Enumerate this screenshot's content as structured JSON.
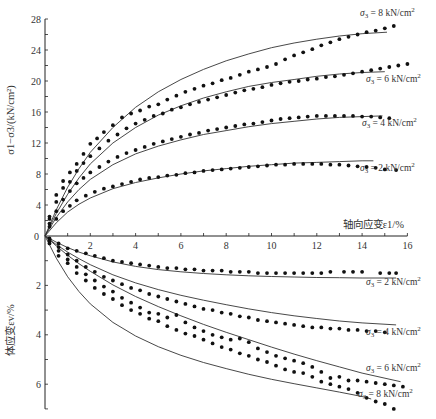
{
  "chart_data": [
    {
      "type": "scatter",
      "panel": "upper",
      "title": "",
      "xlabel": "轴向应变ε1/%",
      "ylabel": "σ1−σ3/(kN/cm²)",
      "xlim": [
        0,
        16
      ],
      "ylim": [
        0,
        28
      ],
      "xticks": [
        "2",
        "4",
        "6",
        "8",
        "10",
        "12",
        "14",
        "16"
      ],
      "xtick_values": [
        2,
        4,
        6,
        8,
        10,
        12,
        14,
        16
      ],
      "yticks": [
        "0",
        "4",
        "8",
        "12",
        "16",
        "20",
        "24",
        "28"
      ],
      "ytick_values": [
        0,
        4,
        8,
        12,
        16,
        20,
        24,
        28
      ],
      "grid": false,
      "series": [
        {
          "name": "σ3 = 8 kN/cm²",
          "label": "σ3 = 8 kN/cm²",
          "fit_x": [
            0,
            0.5,
            1,
            1.5,
            2,
            3,
            4,
            5,
            6,
            7,
            8,
            9,
            10,
            11,
            12,
            13,
            14,
            15.1
          ],
          "fit_y": [
            0,
            3.4,
            6.3,
            8.7,
            10.8,
            14.0,
            16.6,
            18.6,
            20.2,
            21.5,
            22.6,
            23.5,
            24.3,
            24.9,
            25.4,
            25.8,
            26.1,
            26.3
          ],
          "points_x": [
            0.2,
            0.5,
            0.8,
            1.1,
            1.4,
            1.7,
            2.0,
            2.3,
            2.6,
            3.0,
            3.4,
            3.8,
            4.2,
            4.6,
            5.0,
            5.4,
            5.8,
            6.2,
            6.6,
            7.0,
            7.4,
            7.8,
            8.2,
            8.6,
            9.0,
            9.4,
            9.8,
            10.2,
            10.6,
            11.0,
            11.4,
            11.8,
            12.2,
            12.6,
            13.0,
            13.4,
            13.8,
            14.2,
            14.6,
            15.0,
            15.4
          ],
          "points_y": [
            2.5,
            5.3,
            7.1,
            8.2,
            9.3,
            10.6,
            11.9,
            12.6,
            13.4,
            14.3,
            15.3,
            15.8,
            16.2,
            16.7,
            17.0,
            17.6,
            18.1,
            18.6,
            19.0,
            19.4,
            19.7,
            20.1,
            20.4,
            20.8,
            21.2,
            21.5,
            21.8,
            22.2,
            22.8,
            23.3,
            23.7,
            24.1,
            24.6,
            25.0,
            25.4,
            25.7,
            26.0,
            26.3,
            26.5,
            26.8,
            27.1
          ]
        },
        {
          "name": "σ3 = 6 kN/cm²",
          "label": "σ3 = 6 kN/cm²",
          "fit_x": [
            0,
            0.5,
            1,
            1.5,
            2,
            3,
            4,
            5,
            6,
            7,
            8,
            9,
            10,
            11,
            12,
            13,
            14,
            15.0
          ],
          "fit_y": [
            0,
            2.9,
            5.4,
            7.5,
            9.3,
            12.0,
            14.0,
            15.6,
            16.8,
            17.8,
            18.6,
            19.3,
            19.8,
            20.2,
            20.6,
            20.9,
            21.1,
            21.2
          ],
          "points_x": [
            0.2,
            0.5,
            0.8,
            1.1,
            1.4,
            1.7,
            2.0,
            2.4,
            2.8,
            3.2,
            3.6,
            4.0,
            4.4,
            4.8,
            5.2,
            5.6,
            6.0,
            6.4,
            6.8,
            7.2,
            7.6,
            8.0,
            8.4,
            8.8,
            9.2,
            9.6,
            10.0,
            10.4,
            10.8,
            11.2,
            11.6,
            12.0,
            12.4,
            12.8,
            13.2,
            13.6,
            14.0,
            14.4,
            14.8,
            15.2,
            15.6,
            16.0
          ],
          "points_y": [
            2.2,
            4.4,
            6.2,
            7.0,
            8.4,
            9.4,
            10.3,
            11.3,
            12.3,
            13.1,
            13.9,
            14.5,
            15.0,
            15.5,
            15.8,
            16.3,
            16.6,
            17.0,
            17.3,
            17.6,
            17.9,
            18.2,
            18.5,
            18.8,
            19.0,
            19.2,
            19.5,
            19.7,
            19.9,
            20.0,
            20.2,
            20.3,
            20.5,
            20.6,
            20.8,
            21.0,
            21.2,
            21.4,
            21.6,
            21.8,
            22.0,
            22.2
          ]
        },
        {
          "name": "σ3 = 4 kN/cm²",
          "label": "σ3 = 4 kN/cm²",
          "fit_x": [
            0,
            0.5,
            1,
            1.5,
            2,
            3,
            4,
            5,
            6,
            7,
            8,
            9,
            10,
            11,
            12,
            13,
            14,
            14.9
          ],
          "fit_y": [
            0,
            2.4,
            4.4,
            6.0,
            7.3,
            9.2,
            10.6,
            11.6,
            12.4,
            13.1,
            13.6,
            14.1,
            14.5,
            14.8,
            15.1,
            15.3,
            15.4,
            15.5
          ],
          "points_x": [
            0.2,
            0.5,
            0.8,
            1.1,
            1.4,
            1.7,
            2.0,
            2.4,
            2.8,
            3.2,
            3.6,
            4.0,
            4.4,
            4.8,
            5.2,
            5.6,
            6.0,
            6.4,
            6.8,
            7.2,
            7.6,
            8.0,
            8.4,
            8.8,
            9.2,
            9.6,
            10.0,
            10.4,
            10.8,
            11.2,
            11.6,
            12.0,
            12.4,
            12.8,
            13.2,
            13.6,
            14.0,
            14.4,
            14.8,
            15.2
          ],
          "points_y": [
            1.6,
            3.2,
            4.7,
            5.8,
            6.8,
            7.5,
            8.2,
            8.9,
            9.6,
            10.2,
            10.7,
            11.1,
            11.5,
            11.9,
            12.2,
            12.5,
            12.8,
            13.1,
            13.3,
            13.6,
            13.8,
            14.0,
            14.2,
            14.4,
            14.5,
            14.7,
            14.9,
            15.1,
            15.2,
            15.3,
            15.4,
            15.5,
            15.5,
            15.5,
            15.5,
            15.5,
            15.4,
            15.4,
            15.3,
            15.2
          ]
        },
        {
          "name": "σ3 = 2 kN/cm²",
          "label": "σ3 = 2 kN/cm²",
          "fit_x": [
            0,
            0.5,
            1,
            1.5,
            2,
            3,
            4,
            5,
            6,
            7,
            8,
            9,
            10,
            11,
            12,
            13,
            14,
            14.5
          ],
          "fit_y": [
            0,
            1.7,
            3.1,
            4.1,
            4.9,
            6.1,
            6.9,
            7.5,
            8.0,
            8.4,
            8.7,
            9.0,
            9.2,
            9.4,
            9.5,
            9.6,
            9.7,
            9.7
          ],
          "points_x": [
            0.2,
            0.5,
            0.8,
            1.1,
            1.4,
            1.8,
            2.2,
            2.6,
            3.0,
            3.4,
            3.8,
            4.2,
            4.6,
            5.0,
            5.4,
            5.8,
            6.2,
            6.6,
            7.0,
            7.4,
            7.8,
            8.2,
            8.6,
            9.0,
            9.4,
            9.8,
            10.2,
            10.6,
            11.0,
            11.4,
            11.8,
            12.2,
            12.6,
            13.0,
            13.4,
            13.8,
            14.2,
            14.6,
            15.0,
            15.5
          ],
          "points_y": [
            1.2,
            2.2,
            3.2,
            3.9,
            4.6,
            5.2,
            5.7,
            6.1,
            6.4,
            6.7,
            7.0,
            7.3,
            7.5,
            7.6,
            7.8,
            7.9,
            8.1,
            8.2,
            8.4,
            8.5,
            8.6,
            8.7,
            8.8,
            8.9,
            9.0,
            9.1,
            9.2,
            9.2,
            9.3,
            9.3,
            9.3,
            9.3,
            9.2,
            9.2,
            9.1,
            9.0,
            8.9,
            8.8,
            8.6,
            8.5
          ]
        }
      ]
    },
    {
      "type": "scatter",
      "panel": "lower",
      "title": "",
      "xlabel": "轴向应变ε1/%",
      "ylabel": "体应变εv/%",
      "xlim": [
        0,
        16
      ],
      "ylim": [
        0,
        7
      ],
      "yaxis_inverted": true,
      "yticks": [
        "2",
        "4",
        "6"
      ],
      "ytick_values": [
        2,
        4,
        6
      ],
      "grid": false,
      "series": [
        {
          "name": "σ3 = 2 kN/cm²",
          "label": "σ3 = 2 kN/cm²",
          "fit_x": [
            0,
            0.5,
            1,
            1.5,
            2,
            3,
            4,
            5,
            6,
            7,
            8,
            9,
            10,
            11,
            12,
            13,
            14,
            15.5
          ],
          "fit_y": [
            0,
            0.25,
            0.47,
            0.65,
            0.8,
            1.05,
            1.23,
            1.36,
            1.45,
            1.52,
            1.57,
            1.61,
            1.64,
            1.66,
            1.68,
            1.69,
            1.7,
            1.7
          ],
          "points_x": [
            0.2,
            0.6,
            1.0,
            1.4,
            1.8,
            2.2,
            2.6,
            3.0,
            3.4,
            3.8,
            4.2,
            4.6,
            5.0,
            5.4,
            5.8,
            6.2,
            6.6,
            7.0,
            7.4,
            7.8,
            8.2,
            8.6,
            9.0,
            9.4,
            9.8,
            10.2,
            10.6,
            11.0,
            11.4,
            11.8,
            12.2,
            12.6,
            13.2,
            13.6,
            14.0,
            14.8,
            15.2,
            15.5
          ],
          "points_y": [
            0.1,
            0.3,
            0.5,
            0.6,
            0.7,
            0.8,
            0.9,
            1.0,
            1.05,
            1.1,
            1.15,
            1.2,
            1.25,
            1.3,
            1.3,
            1.35,
            1.35,
            1.4,
            1.4,
            1.4,
            1.45,
            1.45,
            1.45,
            1.5,
            1.5,
            1.5,
            1.5,
            1.5,
            1.5,
            1.5,
            1.5,
            1.45,
            1.45,
            1.45,
            1.45,
            1.5,
            1.5,
            1.5
          ]
        },
        {
          "name": "σ3 = 4 kN/cm²",
          "label": "σ3 = 4 kN/cm²",
          "fit_x": [
            0,
            0.5,
            1,
            1.5,
            2,
            3,
            4,
            5,
            6,
            7,
            8,
            9,
            10,
            11,
            12,
            13,
            14,
            15.5
          ],
          "fit_y": [
            0,
            0.35,
            0.65,
            0.92,
            1.16,
            1.57,
            1.9,
            2.17,
            2.4,
            2.6,
            2.78,
            2.95,
            3.1,
            3.23,
            3.34,
            3.44,
            3.52,
            3.6
          ],
          "points_x": [
            0.2,
            0.6,
            1.0,
            1.4,
            1.8,
            2.2,
            2.6,
            3.0,
            3.4,
            3.8,
            4.2,
            4.6,
            5.0,
            5.4,
            5.8,
            6.2,
            6.6,
            7.0,
            7.4,
            7.8,
            8.2,
            8.6,
            9.0,
            9.4,
            9.8,
            10.2,
            10.6,
            11.0,
            11.4,
            11.8,
            12.2,
            12.6,
            13.0,
            13.4,
            13.8,
            14.2,
            14.6,
            15.0
          ],
          "points_y": [
            0.15,
            0.45,
            0.75,
            1.0,
            1.25,
            1.45,
            1.65,
            1.8,
            1.95,
            2.1,
            2.2,
            2.35,
            2.45,
            2.55,
            2.65,
            2.75,
            2.85,
            2.95,
            3.0,
            3.1,
            3.15,
            3.25,
            3.3,
            3.4,
            3.45,
            3.5,
            3.55,
            3.6,
            3.65,
            3.7,
            3.7,
            3.75,
            3.75,
            3.8,
            3.8,
            3.85,
            3.85,
            3.9
          ]
        },
        {
          "name": "σ3 = 6 kN/cm²",
          "label": "σ3 = 6 kN/cm²",
          "fit_x": [
            0,
            0.5,
            1,
            1.5,
            2,
            3,
            4,
            5,
            6,
            7,
            8,
            9,
            10,
            11,
            12,
            13,
            14,
            15.7
          ],
          "fit_y": [
            0,
            0.4,
            0.78,
            1.12,
            1.43,
            1.98,
            2.45,
            2.86,
            3.23,
            3.58,
            3.9,
            4.2,
            4.5,
            4.78,
            5.05,
            5.3,
            5.55,
            5.9
          ],
          "points_x": [
            0.2,
            0.6,
            1.0,
            1.4,
            1.8,
            2.2,
            2.6,
            3.0,
            3.4,
            3.8,
            4.2,
            4.6,
            5.0,
            5.4,
            5.8,
            6.2,
            6.6,
            7.0,
            7.4,
            7.8,
            8.2,
            8.6,
            9.0,
            9.4,
            9.8,
            10.2,
            10.6,
            11.0,
            11.4,
            11.8,
            12.2,
            12.6,
            13.0,
            13.4,
            13.8,
            14.2,
            14.6,
            15.0,
            15.4,
            15.8
          ],
          "points_y": [
            0.2,
            0.6,
            0.95,
            1.25,
            1.55,
            1.8,
            2.05,
            2.25,
            2.5,
            2.7,
            2.9,
            3.1,
            3.15,
            3.3,
            3.2,
            3.5,
            3.7,
            3.85,
            4.0,
            4.1,
            4.2,
            4.15,
            4.3,
            4.55,
            4.7,
            4.85,
            4.95,
            5.05,
            5.15,
            5.3,
            5.5,
            5.75,
            5.7,
            5.85,
            5.85,
            5.9,
            5.95,
            6.0,
            6.05,
            6.1
          ]
        },
        {
          "name": "σ3 = 8 kN/cm²",
          "label": "σ3 = 8 kN/cm²",
          "fit_x": [
            0,
            0.5,
            1,
            1.5,
            2,
            3,
            4,
            5,
            6,
            7,
            8,
            9,
            10,
            11,
            12,
            13,
            14,
            14.4
          ],
          "fit_y": [
            0,
            0.9,
            1.65,
            2.25,
            2.75,
            3.5,
            4.05,
            4.48,
            4.83,
            5.12,
            5.37,
            5.6,
            5.8,
            5.98,
            6.15,
            6.32,
            6.5,
            6.6
          ],
          "points_x": [
            0.2,
            0.6,
            1.0,
            1.4,
            1.8,
            2.2,
            2.6,
            3.0,
            3.4,
            3.8,
            4.2,
            4.6,
            5.0,
            5.4,
            5.8,
            6.2,
            6.6,
            7.0,
            7.4,
            7.8,
            8.2,
            8.6,
            9.0,
            9.4,
            9.8,
            10.2,
            10.6,
            11.0,
            11.4,
            11.8,
            12.2,
            12.6,
            13.0,
            13.4,
            13.8,
            14.2,
            14.6,
            15.0,
            15.4
          ],
          "points_y": [
            0.3,
            0.8,
            1.1,
            1.5,
            1.8,
            2.1,
            2.35,
            2.55,
            2.8,
            3.0,
            3.15,
            3.35,
            3.45,
            3.65,
            3.8,
            3.95,
            4.05,
            4.2,
            4.35,
            4.5,
            4.6,
            4.75,
            4.85,
            5.0,
            5.1,
            5.25,
            5.4,
            5.5,
            5.55,
            5.7,
            5.9,
            6.0,
            6.1,
            6.2,
            6.35,
            6.55,
            6.7,
            6.8,
            7.0
          ]
        }
      ]
    }
  ],
  "labels": {
    "origin": "0",
    "xaxis_title": "轴向应变ε1/%",
    "upper_ylabel": "σ1−σ3/(kN/cm²)",
    "lower_ylabel": "体应变εv/%"
  }
}
